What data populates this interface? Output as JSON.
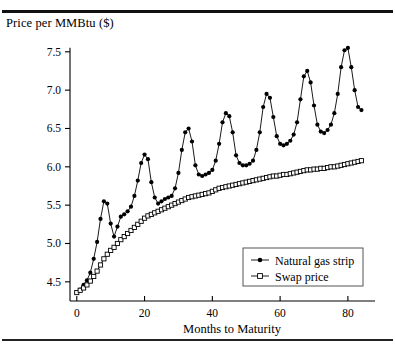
{
  "chart_data": {
    "type": "line",
    "title": "Price per MMBtu ($)",
    "xlabel": "Months to Maturity",
    "ylabel": "Price per MMBtu ($)",
    "xlim": [
      -2,
      88
    ],
    "ylim": [
      4.25,
      7.68
    ],
    "grid": false,
    "legend_position": "inside-lower-right",
    "xticks": [
      0,
      20,
      40,
      60,
      80
    ],
    "xtick_labels": [
      "0",
      "20",
      "40",
      "60",
      "80"
    ],
    "yticks": [
      4.5,
      5.0,
      5.5,
      6.0,
      6.5,
      7.0,
      7.5
    ],
    "ytick_labels": [
      "4.5",
      "5.0",
      "5.5",
      "6.0",
      "6.5",
      "7.0",
      "7.5"
    ],
    "series": [
      {
        "name": "Natural gas strip",
        "marker": "filled-circle",
        "color": "#000000",
        "x": [
          0,
          1,
          2,
          3,
          4,
          5,
          6,
          7,
          8,
          9,
          10,
          11,
          12,
          13,
          14,
          15,
          16,
          17,
          18,
          19,
          20,
          21,
          22,
          23,
          24,
          25,
          26,
          27,
          28,
          29,
          30,
          31,
          32,
          33,
          34,
          35,
          36,
          37,
          38,
          39,
          40,
          41,
          42,
          43,
          44,
          45,
          46,
          47,
          48,
          49,
          50,
          51,
          52,
          53,
          54,
          55,
          56,
          57,
          58,
          59,
          60,
          61,
          62,
          63,
          64,
          65,
          66,
          67,
          68,
          69,
          70,
          71,
          72,
          73,
          74,
          75,
          76,
          77,
          78,
          79,
          80,
          81,
          82,
          83,
          84
        ],
        "values": [
          4.36,
          4.4,
          4.46,
          4.52,
          4.62,
          4.8,
          5.02,
          5.32,
          5.55,
          5.52,
          5.26,
          5.09,
          5.22,
          5.35,
          5.38,
          5.42,
          5.48,
          5.62,
          5.82,
          6.05,
          6.16,
          6.1,
          5.8,
          5.6,
          5.52,
          5.55,
          5.58,
          5.6,
          5.62,
          5.72,
          5.92,
          6.22,
          6.45,
          6.5,
          6.33,
          6.02,
          5.9,
          5.88,
          5.9,
          5.92,
          5.96,
          6.08,
          6.3,
          6.58,
          6.7,
          6.66,
          6.45,
          6.15,
          6.05,
          6.02,
          6.02,
          6.04,
          6.08,
          6.22,
          6.45,
          6.78,
          6.95,
          6.9,
          6.65,
          6.4,
          6.3,
          6.28,
          6.3,
          6.34,
          6.42,
          6.58,
          6.88,
          7.18,
          7.25,
          7.1,
          6.8,
          6.55,
          6.46,
          6.44,
          6.48,
          6.55,
          6.7,
          6.95,
          7.3,
          7.52,
          7.55,
          7.3,
          7.0,
          6.78,
          6.74
        ]
      },
      {
        "name": "Swap price",
        "marker": "open-square",
        "color": "#000000",
        "x": [
          0,
          1,
          2,
          3,
          4,
          5,
          6,
          7,
          8,
          9,
          10,
          11,
          12,
          13,
          14,
          15,
          16,
          17,
          18,
          19,
          20,
          21,
          22,
          23,
          24,
          25,
          26,
          27,
          28,
          29,
          30,
          31,
          32,
          33,
          34,
          35,
          36,
          37,
          38,
          39,
          40,
          41,
          42,
          43,
          44,
          45,
          46,
          47,
          48,
          49,
          50,
          51,
          52,
          53,
          54,
          55,
          56,
          57,
          58,
          59,
          60,
          61,
          62,
          63,
          64,
          65,
          66,
          67,
          68,
          69,
          70,
          71,
          72,
          73,
          74,
          75,
          76,
          77,
          78,
          79,
          80,
          81,
          82,
          83,
          84
        ],
        "values": [
          4.36,
          4.39,
          4.42,
          4.46,
          4.51,
          4.57,
          4.64,
          4.72,
          4.8,
          4.86,
          4.91,
          4.95,
          5.0,
          5.05,
          5.09,
          5.13,
          5.17,
          5.21,
          5.25,
          5.29,
          5.33,
          5.36,
          5.38,
          5.4,
          5.42,
          5.44,
          5.46,
          5.48,
          5.5,
          5.52,
          5.54,
          5.56,
          5.58,
          5.6,
          5.61,
          5.62,
          5.63,
          5.64,
          5.65,
          5.66,
          5.68,
          5.7,
          5.72,
          5.73,
          5.74,
          5.75,
          5.76,
          5.77,
          5.78,
          5.79,
          5.8,
          5.81,
          5.82,
          5.83,
          5.84,
          5.85,
          5.86,
          5.87,
          5.88,
          5.88,
          5.89,
          5.9,
          5.9,
          5.91,
          5.92,
          5.93,
          5.94,
          5.95,
          5.96,
          5.96,
          5.97,
          5.97,
          5.98,
          5.98,
          5.99,
          6.0,
          6.0,
          6.01,
          6.02,
          6.03,
          6.04,
          6.05,
          6.06,
          6.07,
          6.08
        ]
      }
    ],
    "legend": [
      {
        "label": "Natural gas strip",
        "marker": "filled-circle"
      },
      {
        "label": "Swap price",
        "marker": "open-square"
      }
    ]
  }
}
